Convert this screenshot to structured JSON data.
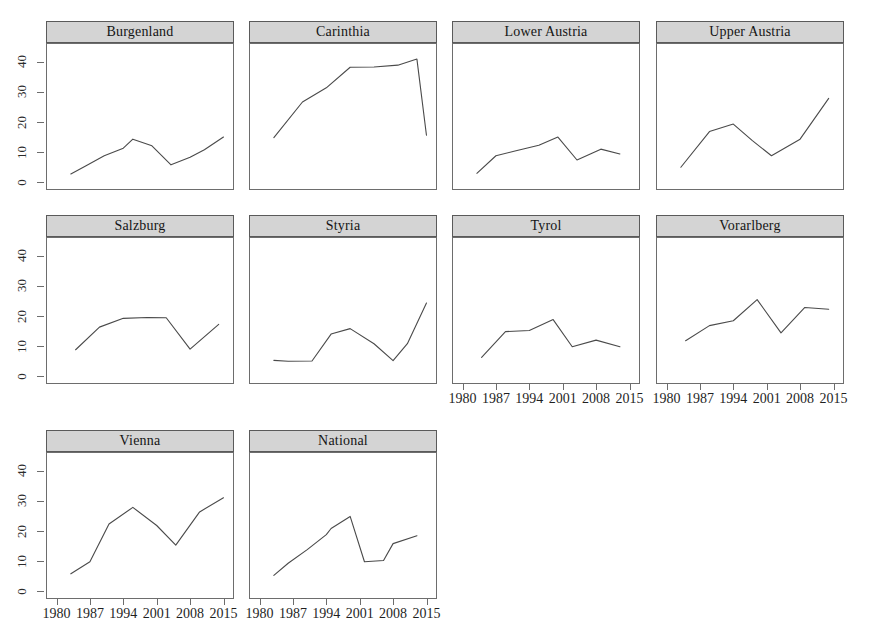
{
  "chart_data": {
    "type": "line",
    "title": "",
    "subtitle": "",
    "xlabel": "",
    "ylabel": "",
    "xlim": [
      1978,
      2017
    ],
    "ylim": [
      -2,
      46
    ],
    "grid": false,
    "legend": null,
    "layout": {
      "rows": 3,
      "cols": 4,
      "panel_order": [
        [
          "Burgenland",
          "Carinthia",
          "Lower Austria",
          "Upper Austria"
        ],
        [
          "Salzburg",
          "Styria",
          "Tyrol",
          "Vorarlberg"
        ],
        [
          "Vienna",
          "National",
          null,
          null
        ]
      ]
    },
    "x_ticks": [
      1980,
      1987,
      1994,
      2001,
      2008,
      2015
    ],
    "x_tick_labels": [
      "1980",
      "1987",
      "1994",
      "2001",
      "2008",
      "2015"
    ],
    "y_ticks": [
      0,
      10,
      20,
      30,
      40
    ],
    "y_tick_labels": [
      "0",
      "10",
      "20",
      "30",
      "40"
    ],
    "colors": {
      "line": "#4a4a4a",
      "strip_background": "#d4d4d4",
      "strip_border": "#5a5a5a",
      "panel_border": "#6d6d6d",
      "panel_background": "#ffffff",
      "text": "#1a1a1a"
    },
    "panels": [
      {
        "name": "Burgenland",
        "x": [
          1983,
          1986,
          1990,
          1994,
          1996,
          2000,
          2004,
          2008,
          2011,
          2015
        ],
        "y": [
          3.0,
          5.5,
          9.0,
          11.5,
          14.5,
          12.3,
          6.0,
          8.5,
          11.0,
          15.2
        ]
      },
      {
        "name": "Carinthia",
        "x": [
          1983,
          1989,
          1994,
          1999,
          2004,
          2009,
          2013,
          2015
        ],
        "y": [
          15.0,
          26.8,
          31.5,
          38.3,
          38.4,
          39.0,
          41.0,
          15.8
        ]
      },
      {
        "name": "Lower Austria",
        "x": [
          1983,
          1987,
          1991,
          1996,
          2000,
          2004,
          2009,
          2013
        ],
        "y": [
          3.2,
          9.0,
          10.6,
          12.5,
          15.2,
          7.6,
          11.2,
          9.6
        ]
      },
      {
        "name": "Upper Austria",
        "x": [
          1983,
          1989,
          1994,
          1998,
          2002,
          2008,
          2014
        ],
        "y": [
          5.2,
          17.0,
          19.5,
          14.0,
          9.0,
          14.5,
          28.0
        ]
      },
      {
        "name": "Salzburg",
        "x": [
          1984,
          1989,
          1994,
          1999,
          2003,
          2008,
          2014
        ],
        "y": [
          9.0,
          16.5,
          19.4,
          19.7,
          19.6,
          9.2,
          17.4
        ]
      },
      {
        "name": "Styria",
        "x": [
          1983,
          1986,
          1991,
          1995,
          1999,
          2004,
          2008,
          2011,
          2015
        ],
        "y": [
          5.5,
          5.2,
          5.3,
          14.2,
          16.0,
          11.0,
          5.4,
          11.0,
          24.5
        ]
      },
      {
        "name": "Tyrol",
        "x": [
          1984,
          1989,
          1994,
          1999,
          2003,
          2008,
          2013
        ],
        "y": [
          6.5,
          15.0,
          15.4,
          19.0,
          10.0,
          12.2,
          10.0
        ]
      },
      {
        "name": "Vorarlberg",
        "x": [
          1984,
          1989,
          1994,
          1999,
          2004,
          2009,
          2014
        ],
        "y": [
          12.0,
          17.0,
          18.6,
          25.6,
          14.6,
          23.0,
          22.4
        ]
      },
      {
        "name": "Vienna",
        "x": [
          1983,
          1987,
          1991,
          1996,
          2001,
          2005,
          2010,
          2015
        ],
        "y": [
          6.0,
          10.0,
          22.5,
          28.0,
          22.0,
          15.5,
          26.5,
          31.2
        ]
      },
      {
        "name": "National",
        "x": [
          1983,
          1986,
          1990,
          1994,
          1995,
          1999,
          2002,
          2006,
          2008,
          2013
        ],
        "y": [
          5.5,
          9.5,
          14.0,
          19.0,
          21.0,
          25.0,
          10.0,
          10.4,
          16.0,
          18.6
        ]
      }
    ]
  },
  "axis": {
    "y_labels": [
      "0",
      "10",
      "20",
      "30",
      "40"
    ],
    "x_labels": [
      "1980",
      "1987",
      "1994",
      "2001",
      "2008",
      "2015"
    ]
  },
  "strips": {
    "burgenland": "Burgenland",
    "carinthia": "Carinthia",
    "lower_austria": "Lower Austria",
    "upper_austria": "Upper Austria",
    "salzburg": "Salzburg",
    "styria": "Styria",
    "tyrol": "Tyrol",
    "vorarlberg": "Vorarlberg",
    "vienna": "Vienna",
    "national": "National"
  }
}
